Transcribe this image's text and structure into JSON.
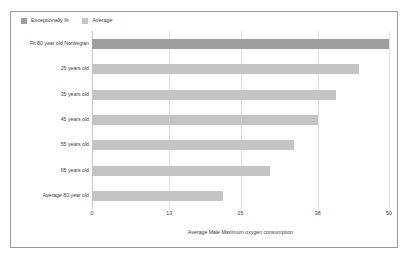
{
  "chart_data": {
    "type": "bar",
    "orientation": "horizontal",
    "title": "",
    "xlabel": "Average Male Maximum oxygen consumption",
    "ylabel": "",
    "xlim": [
      0,
      50
    ],
    "xticks": [
      0,
      13,
      25,
      38,
      50
    ],
    "xtick_labels": [
      "0",
      "13",
      "25",
      "38",
      "50"
    ],
    "grid": true,
    "legend_position": "top-left",
    "legend": [
      {
        "label": "Exceptionally fit",
        "color": "#9e9e9e"
      },
      {
        "label": "Average",
        "color": "#c4c4c4"
      }
    ],
    "categories": [
      "Fit 80 year old Norwegian",
      "25 years old",
      "35 years old",
      "45 years old",
      "55 years old",
      "65 years old",
      "Average 80 year old"
    ],
    "values": [
      50,
      45,
      41,
      38,
      34,
      30,
      22
    ],
    "bar_series": [
      {
        "category": "Fit 80 year old Norwegian",
        "value": 50,
        "series": "Exceptionally fit",
        "color": "#9e9e9e"
      },
      {
        "category": "25 years old",
        "value": 45,
        "series": "Average",
        "color": "#c4c4c4"
      },
      {
        "category": "35 years old",
        "value": 41,
        "series": "Average",
        "color": "#c4c4c4"
      },
      {
        "category": "45 years old",
        "value": 38,
        "series": "Average",
        "color": "#c4c4c4"
      },
      {
        "category": "55 years old",
        "value": 34,
        "series": "Average",
        "color": "#c4c4c4"
      },
      {
        "category": "65 years old",
        "value": 30,
        "series": "Average",
        "color": "#c4c4c4"
      },
      {
        "category": "Average 80 year old",
        "value": 22,
        "series": "Average",
        "color": "#c4c4c4"
      }
    ]
  },
  "colors": {
    "frame_border": "#9a9a9a",
    "gridline": "#e2e2e2",
    "axis": "#c9c9c9",
    "text": "#3c3c3c",
    "background": "#ffffff"
  }
}
